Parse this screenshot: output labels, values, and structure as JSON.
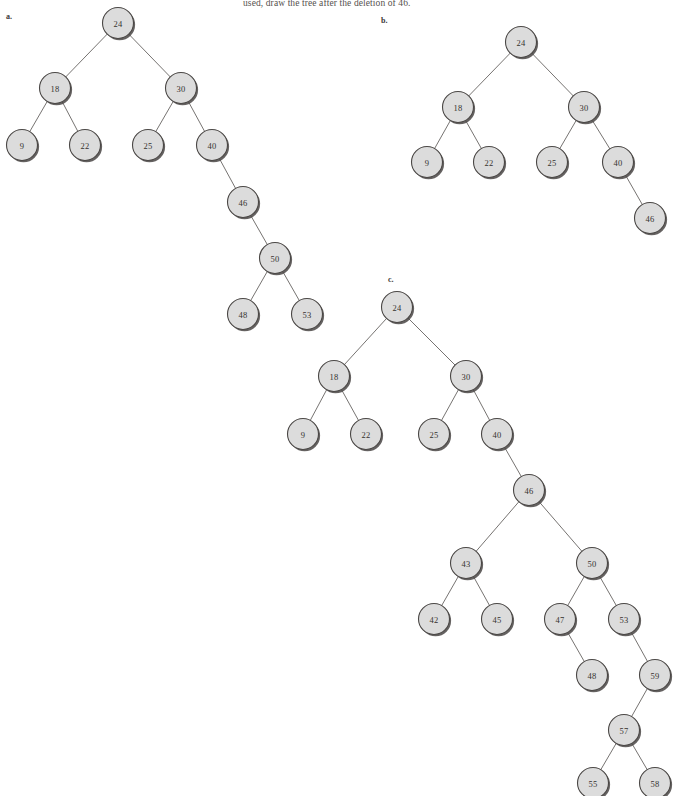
{
  "page": {
    "width": 677,
    "height": 796,
    "background": "#ffffff",
    "header_text": "used, draw the tree after the deletion of 46.",
    "node_fill": "#dcdcdc",
    "node_stroke": "#4a4745",
    "edge_color": "#5d5a57",
    "text_color": "#35322f",
    "node_radius": 15.5
  },
  "figures": [
    {
      "id": "figure-a",
      "label": "a.",
      "label_x": 6,
      "label_y": 12,
      "nodes": [
        {
          "value": "24",
          "x": 118,
          "y": 23
        },
        {
          "value": "18",
          "x": 55,
          "y": 88
        },
        {
          "value": "30",
          "x": 181,
          "y": 88
        },
        {
          "value": "9",
          "x": 22,
          "y": 145
        },
        {
          "value": "22",
          "x": 85,
          "y": 145
        },
        {
          "value": "25",
          "x": 148,
          "y": 145
        },
        {
          "value": "40",
          "x": 212,
          "y": 145
        },
        {
          "value": "46",
          "x": 243,
          "y": 202
        },
        {
          "value": "50",
          "x": 275,
          "y": 258
        },
        {
          "value": "48",
          "x": 243,
          "y": 314
        },
        {
          "value": "53",
          "x": 307,
          "y": 314
        }
      ],
      "edges": [
        [
          0,
          1
        ],
        [
          0,
          2
        ],
        [
          1,
          3
        ],
        [
          1,
          4
        ],
        [
          2,
          5
        ],
        [
          2,
          6
        ],
        [
          6,
          7
        ],
        [
          7,
          8
        ],
        [
          8,
          9
        ],
        [
          8,
          10
        ]
      ]
    },
    {
      "id": "figure-b",
      "label": "b.",
      "label_x": 381,
      "label_y": 16,
      "nodes": [
        {
          "value": "24",
          "x": 521,
          "y": 42
        },
        {
          "value": "18",
          "x": 458,
          "y": 107
        },
        {
          "value": "30",
          "x": 584,
          "y": 107
        },
        {
          "value": "9",
          "x": 427,
          "y": 162
        },
        {
          "value": "22",
          "x": 489,
          "y": 162
        },
        {
          "value": "25",
          "x": 552,
          "y": 162
        },
        {
          "value": "40",
          "x": 618,
          "y": 162
        },
        {
          "value": "46",
          "x": 650,
          "y": 218
        }
      ],
      "edges": [
        [
          0,
          1
        ],
        [
          0,
          2
        ],
        [
          1,
          3
        ],
        [
          1,
          4
        ],
        [
          2,
          5
        ],
        [
          2,
          6
        ],
        [
          6,
          7
        ]
      ]
    },
    {
      "id": "figure-c",
      "label": "c.",
      "label_x": 388,
      "label_y": 275,
      "nodes": [
        {
          "value": "24",
          "x": 397,
          "y": 307
        },
        {
          "value": "18",
          "x": 334,
          "y": 376
        },
        {
          "value": "30",
          "x": 466,
          "y": 376
        },
        {
          "value": "9",
          "x": 303,
          "y": 434
        },
        {
          "value": "22",
          "x": 366,
          "y": 434
        },
        {
          "value": "25",
          "x": 434,
          "y": 434
        },
        {
          "value": "40",
          "x": 497,
          "y": 434
        },
        {
          "value": "46",
          "x": 529,
          "y": 490
        },
        {
          "value": "43",
          "x": 466,
          "y": 563
        },
        {
          "value": "50",
          "x": 592,
          "y": 563
        },
        {
          "value": "42",
          "x": 434,
          "y": 619
        },
        {
          "value": "45",
          "x": 497,
          "y": 619
        },
        {
          "value": "47",
          "x": 560,
          "y": 619
        },
        {
          "value": "53",
          "x": 624,
          "y": 619
        },
        {
          "value": "48",
          "x": 592,
          "y": 675
        },
        {
          "value": "59",
          "x": 655,
          "y": 675
        },
        {
          "value": "57",
          "x": 624,
          "y": 730
        },
        {
          "value": "55",
          "x": 593,
          "y": 783
        },
        {
          "value": "58",
          "x": 655,
          "y": 783
        }
      ],
      "edges": [
        [
          0,
          1
        ],
        [
          0,
          2
        ],
        [
          1,
          3
        ],
        [
          1,
          4
        ],
        [
          2,
          5
        ],
        [
          2,
          6
        ],
        [
          6,
          7
        ],
        [
          7,
          8
        ],
        [
          7,
          9
        ],
        [
          8,
          10
        ],
        [
          8,
          11
        ],
        [
          9,
          12
        ],
        [
          9,
          13
        ],
        [
          12,
          14
        ],
        [
          13,
          15
        ],
        [
          15,
          16
        ],
        [
          16,
          17
        ],
        [
          16,
          18
        ]
      ]
    }
  ]
}
